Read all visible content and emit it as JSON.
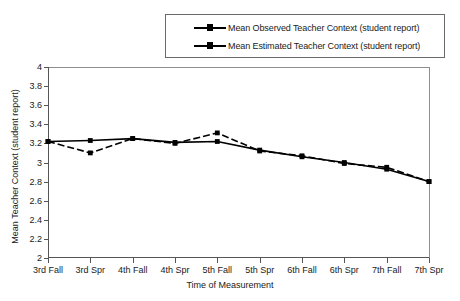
{
  "legend": {
    "entries": [
      {
        "label": "Mean Observed Teacher Context (student report)",
        "style": "dashed-with-marker",
        "color": "#000000"
      },
      {
        "label": "Mean Estimated Teacher Context (student report)",
        "style": "solid-with-marker",
        "color": "#000000"
      }
    ]
  },
  "chart_data": {
    "type": "line",
    "title": "",
    "xlabel": "Time of Measurement",
    "ylabel": "Mean Teacher Context (student report)",
    "categories": [
      "3rd Fall",
      "3rd Spr",
      "4th Fall",
      "4th Spr",
      "5th Fall",
      "5th Spr",
      "6th Fall",
      "6th Spr",
      "7th Fall",
      "7th Spr"
    ],
    "series": [
      {
        "name": "Mean Observed Teacher Context (student report)",
        "values": [
          3.22,
          3.1,
          3.25,
          3.2,
          3.31,
          3.12,
          3.07,
          2.99,
          2.95,
          2.8
        ],
        "line_style": "dashed",
        "marker": "square",
        "color": "#000000"
      },
      {
        "name": "Mean Estimated Teacher Context (student report)",
        "values": [
          3.22,
          3.23,
          3.25,
          3.21,
          3.22,
          3.13,
          3.06,
          3.0,
          2.93,
          2.8
        ],
        "line_style": "solid",
        "marker": "square",
        "color": "#000000"
      }
    ],
    "ylim": [
      2,
      4
    ],
    "yticks": [
      "2",
      "2.2",
      "2.4",
      "2.6",
      "2.8",
      "3",
      "3.2",
      "3.4",
      "3.6",
      "3.8",
      "4"
    ],
    "ytick_values": [
      2,
      2.2,
      2.4,
      2.6,
      2.8,
      3,
      3.2,
      3.4,
      3.6,
      3.8,
      4
    ],
    "grid": false,
    "legend_position": "top"
  }
}
